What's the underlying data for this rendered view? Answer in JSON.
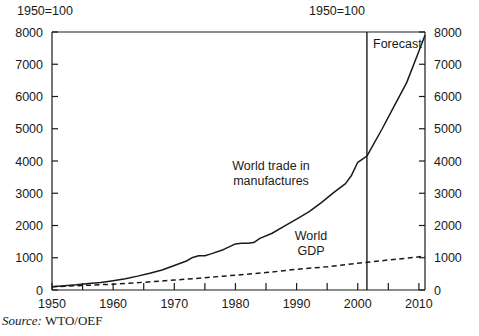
{
  "header": {
    "left_note": "1950=100",
    "right_note": "1950=100"
  },
  "source": {
    "prefix": "Source:",
    "value": "WTO/OEF"
  },
  "annotations": {
    "forecast": "Forecast",
    "trade_line1": "World trade in",
    "trade_line2": "manufactures",
    "gdp_line1": "World",
    "gdp_line2": "GDP"
  },
  "chart_data": {
    "type": "line",
    "title": "",
    "subtitle": "",
    "xlabel": "",
    "ylabel": "",
    "index_base_note": "1950=100",
    "xlim": [
      1950,
      2011
    ],
    "ylim": [
      0,
      8000
    ],
    "xticks_major": [
      1950,
      1960,
      1970,
      1980,
      1990,
      2000,
      2010
    ],
    "xticks_minor": [
      1955,
      1965,
      1975,
      1985,
      1995,
      2005
    ],
    "xtick_labels": [
      "1950",
      "1960",
      "1970",
      "1980",
      "1990",
      "2000",
      "2010"
    ],
    "yticks": [
      0,
      1000,
      2000,
      3000,
      4000,
      5000,
      6000,
      7000,
      8000
    ],
    "ytick_labels": [
      "0",
      "1000",
      "2000",
      "3000",
      "4000",
      "5000",
      "6000",
      "7000",
      "8000"
    ],
    "y_axis_both_sides": true,
    "grid": false,
    "legend": "inline-annotations",
    "forecast_divider_x": 2001.5,
    "series": [
      {
        "name": "World trade in manufactures",
        "style": "solid",
        "color": "#1a1a1a",
        "x": [
          1950,
          1952,
          1954,
          1956,
          1958,
          1960,
          1962,
          1964,
          1966,
          1968,
          1970,
          1972,
          1973,
          1974,
          1975,
          1976,
          1978,
          1980,
          1981,
          1982,
          1983,
          1984,
          1986,
          1988,
          1990,
          1992,
          1994,
          1996,
          1998,
          1999,
          2000,
          2001.5,
          2004,
          2006,
          2008,
          2010,
          2011
        ],
        "values": [
          100,
          130,
          160,
          200,
          235,
          290,
          350,
          430,
          520,
          620,
          760,
          900,
          1010,
          1060,
          1060,
          1120,
          1250,
          1430,
          1450,
          1450,
          1470,
          1600,
          1760,
          1980,
          2200,
          2420,
          2700,
          3010,
          3300,
          3560,
          3960,
          4150,
          5000,
          5720,
          6430,
          7400,
          7900
        ]
      },
      {
        "name": "World GDP",
        "style": "dashed",
        "color": "#1a1a1a",
        "x": [
          1950,
          1955,
          1960,
          1965,
          1970,
          1975,
          1980,
          1985,
          1990,
          1995,
          2000,
          2001.5,
          2005,
          2008,
          2011
        ],
        "values": [
          100,
          140,
          180,
          240,
          310,
          380,
          460,
          540,
          640,
          720,
          830,
          860,
          930,
          985,
          1050
        ]
      }
    ]
  }
}
